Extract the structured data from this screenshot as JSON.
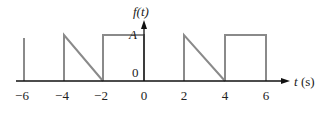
{
  "diagram": {
    "title": "f(t)",
    "y_axis_label": "f(t)",
    "x_axis_label": "t (s)",
    "amplitude_label": "A",
    "origin_label": "0",
    "x_ticks": [
      "−6",
      "−4",
      "−2",
      "0",
      "2",
      "4",
      "6"
    ],
    "waveform_color": "#8a8a8a",
    "axis_color": "#111111",
    "segments": [
      {
        "shape": "vertical-line",
        "t": -6,
        "height": "≈A"
      },
      {
        "shape": "sawtooth",
        "from": -4,
        "to": -2,
        "start": "A",
        "end": 0
      },
      {
        "shape": "rectangle",
        "from": -2,
        "to": 0,
        "level": "A"
      },
      {
        "shape": "sawtooth",
        "from": 2,
        "to": 4,
        "start": "A",
        "end": 0
      },
      {
        "shape": "rectangle",
        "from": 4,
        "to": 6,
        "level": "A"
      }
    ]
  }
}
